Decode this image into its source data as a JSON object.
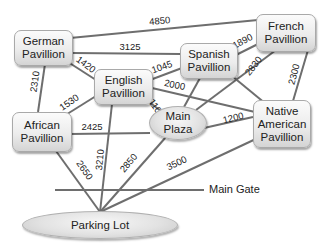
{
  "diagram": {
    "type": "weighted-graph",
    "nodes": {
      "german": {
        "line1": "German",
        "line2": "Pavillion"
      },
      "english": {
        "line1": "English",
        "line2": "Pavillion"
      },
      "spanish": {
        "line1": "Spanish",
        "line2": "Pavillion"
      },
      "french": {
        "line1": "French",
        "line2": "Pavillion"
      },
      "african": {
        "line1": "African",
        "line2": "Pavillion"
      },
      "native": {
        "line1": "Native",
        "line2": "American",
        "line3": "Pavillion"
      },
      "plaza": {
        "line1": "Main",
        "line2": "Plaza"
      },
      "parking": {
        "label": "Parking Lot"
      }
    },
    "main_gate": {
      "label": "Main Gate"
    },
    "edges": [
      {
        "from": "German Pavillion",
        "to": "French Pavillion",
        "weight": "4850"
      },
      {
        "from": "German Pavillion",
        "to": "Spanish Pavillion",
        "weight": "3125"
      },
      {
        "from": "German Pavillion",
        "to": "English Pavillion",
        "weight": "1420"
      },
      {
        "from": "German Pavillion",
        "to": "African Pavillion",
        "weight": "2310"
      },
      {
        "from": "English Pavillion",
        "to": "African Pavillion",
        "weight": "1530"
      },
      {
        "from": "English Pavillion",
        "to": "Spanish Pavillion",
        "weight": "1045"
      },
      {
        "from": "English Pavillion",
        "to": "Native American Pavillion",
        "weight": "2000"
      },
      {
        "from": "English Pavillion",
        "to": "Main Plaza",
        "weight": "1100"
      },
      {
        "from": "English Pavillion",
        "to": "Parking Lot",
        "weight": "3210"
      },
      {
        "from": "Spanish Pavillion",
        "to": "French Pavillion",
        "weight": "1890"
      },
      {
        "from": "Spanish Pavillion",
        "to": "Main Plaza",
        "weight": ""
      },
      {
        "from": "Spanish Pavillion",
        "to": "Native American Pavillion",
        "weight": ""
      },
      {
        "from": "French Pavillion",
        "to": "Main Plaza",
        "weight": "2830"
      },
      {
        "from": "French Pavillion",
        "to": "Native American Pavillion",
        "weight": "2300"
      },
      {
        "from": "African Pavillion",
        "to": "Main Plaza",
        "weight": "2425"
      },
      {
        "from": "African Pavillion",
        "to": "Parking Lot",
        "weight": "2650"
      },
      {
        "from": "Main Plaza",
        "to": "Native American Pavillion",
        "weight": "1200"
      },
      {
        "from": "Main Plaza",
        "to": "Parking Lot",
        "weight": "2850"
      },
      {
        "from": "Native American Pavillion",
        "to": "Parking Lot",
        "weight": "3500"
      }
    ],
    "colors": {
      "edge": "#6e6e6e",
      "node_fill": "#e6e6e6",
      "text": "#222222"
    }
  }
}
